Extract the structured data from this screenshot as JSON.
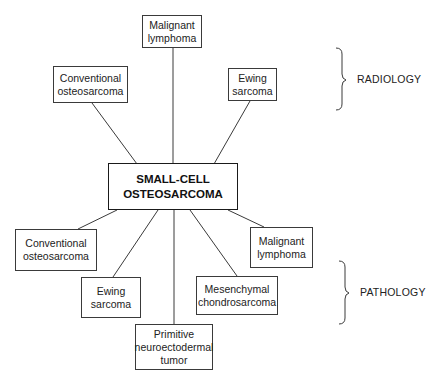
{
  "diagram": {
    "center": {
      "lines": [
        "SMALL-CELL",
        "OSTEOSARCOMA"
      ]
    },
    "radiology": {
      "label": "RADIOLOGY",
      "nodes": [
        {
          "id": "radiology-malignant-lymphoma",
          "lines": [
            "Malignant",
            "lymphoma"
          ]
        },
        {
          "id": "radiology-conventional-osteosarcoma",
          "lines": [
            "Conventional",
            "osteosarcoma"
          ]
        },
        {
          "id": "radiology-ewing-sarcoma",
          "lines": [
            "Ewing",
            "sarcoma"
          ]
        }
      ]
    },
    "pathology": {
      "label": "PATHOLOGY",
      "nodes": [
        {
          "id": "pathology-conventional-osteosarcoma",
          "lines": [
            "Conventional",
            "osteosarcoma"
          ]
        },
        {
          "id": "pathology-ewing-sarcoma",
          "lines": [
            "Ewing",
            "sarcoma"
          ]
        },
        {
          "id": "pathology-pnet",
          "lines": [
            "Primitive",
            "neuroectodermal",
            "tumor"
          ]
        },
        {
          "id": "pathology-mesenchymal-chondrosarcoma",
          "lines": [
            "Mesenchymal",
            "chondrosarcoma"
          ]
        },
        {
          "id": "pathology-malignant-lymphoma",
          "lines": [
            "Malignant",
            "lymphoma"
          ]
        }
      ]
    },
    "colors": {
      "stroke": "#3a3a3a",
      "text": "#222222",
      "background": "#ffffff"
    }
  }
}
